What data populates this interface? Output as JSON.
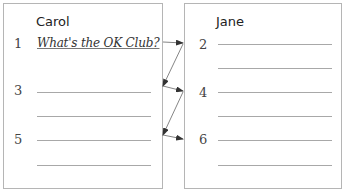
{
  "left": {
    "title": "Carol",
    "numbers": [
      "1",
      "3",
      "5"
    ],
    "question": "What's the OK Club?"
  },
  "right": {
    "title": "Jane",
    "numbers": [
      "2",
      "4",
      "6"
    ]
  },
  "colors": {
    "border": "#b5b5b5",
    "line": "#a8a8a8",
    "arrow": "#333333"
  }
}
